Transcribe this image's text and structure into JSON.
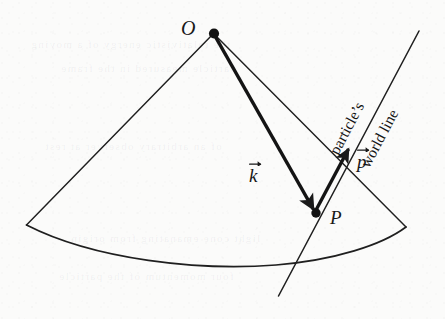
{
  "figure": {
    "background_color": "#fbfbfa",
    "ink_color": "#1a1a1a",
    "ghost_rows": [
      "the relativistic energy of a moving",
      "particle measured in the frame",
      "of an arbitrary observer at rest",
      "light cone emanating from origin",
      "four momentum of the particle"
    ]
  },
  "labels": {
    "origin_point": "ᵊO",
    "origin_point_glyph": "O",
    "event_point": "P",
    "wave_vector": "k",
    "momentum_vector": "p",
    "worldline_line1": "particle’s",
    "worldline_line2": "world line"
  },
  "geometry": {
    "apex": {
      "x": 214,
      "y": 33
    },
    "event": {
      "x": 316,
      "y": 213
    },
    "momentum_tip": {
      "x": 350,
      "y": 137
    },
    "worldline_top": {
      "x": 419,
      "y": 31
    },
    "worldline_bottom": {
      "x": 278,
      "y": 296
    },
    "cone_left_base": {
      "x": 26,
      "y": 225
    },
    "cone_right_base": {
      "x": 406,
      "y": 227
    },
    "base_arc_depth": 22
  },
  "elements": {
    "cone_left_edge": "cone-left-generator",
    "cone_right_edge": "cone-right-generator",
    "cone_base_arc": "cone-base-ellipse-arc",
    "wave_vector_arrow": "k-vector-arrow",
    "momentum_vector_arrow": "p-vector-arrow",
    "worldline_segment": "particle-world-line",
    "apex_dot": "origin-event-dot",
    "event_dot": "event-point-dot"
  }
}
